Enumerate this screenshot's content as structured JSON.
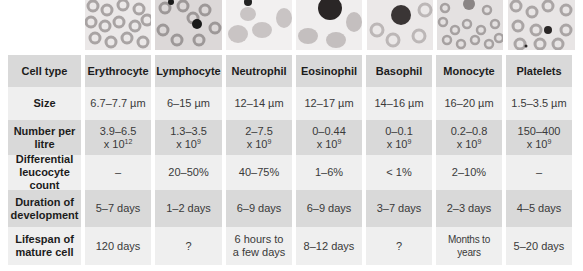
{
  "columns": [
    {
      "key": "erythrocyte",
      "label": "Erythrocyte",
      "size": "6.7–7.7 µm",
      "number_line1": "3.9–6.5",
      "number_base": "x 10",
      "number_exp": "12",
      "differential": "–",
      "duration": "5–7 days",
      "lifespan": "120 days"
    },
    {
      "key": "lymphocyte",
      "label": "Lymphocyte",
      "size": "6–15 µm",
      "number_line1": "1.3–3.5",
      "number_base": "x 10",
      "number_exp": "9",
      "differential": "20–50%",
      "duration": "1–2 days",
      "lifespan": "?"
    },
    {
      "key": "neutrophil",
      "label": "Neutrophil",
      "size": "12–14 µm",
      "number_line1": "2–7.5",
      "number_base": "x 10",
      "number_exp": "9",
      "differential": "40–75%",
      "duration": "6–9 days",
      "lifespan": "6 hours to a few days"
    },
    {
      "key": "eosinophil",
      "label": "Eosinophil",
      "size": "12–17 µm",
      "number_line1": "0–0.44",
      "number_base": "x 10",
      "number_exp": "9",
      "differential": "1–6%",
      "duration": "6–9 days",
      "lifespan": "8–12 days"
    },
    {
      "key": "basophil",
      "label": "Basophil",
      "size": "14–16 µm",
      "number_line1": "0–0.1",
      "number_base": "x 10",
      "number_exp": "9",
      "differential": "< 1%",
      "duration": "3–7 days",
      "lifespan": "?"
    },
    {
      "key": "monocyte",
      "label": "Monocyte",
      "size": "16–20 µm",
      "number_line1": "0.2–0.8",
      "number_base": "x 10",
      "number_exp": "9",
      "differential": "2–10%",
      "duration": "2–3 days",
      "lifespan": "Months to years"
    },
    {
      "key": "platelets",
      "label": "Platelets",
      "size": "1.5–3.5 µm",
      "number_line1": "150–400",
      "number_base": "x 10",
      "number_exp": "9",
      "differential": "–",
      "duration": "4–5 days",
      "lifespan": "5–20 days"
    }
  ],
  "row_labels": {
    "cell_type": "Cell type",
    "size": "Size",
    "number": "Number per litre",
    "differential": "Differential leucocyte count",
    "duration": "Duration of development",
    "lifespan": "Lifespan of mature cell"
  },
  "images": [
    {
      "name": "erythrocyte-micrograph",
      "x": 85,
      "w": 66
    },
    {
      "name": "lymphocyte-micrograph",
      "x": 155,
      "w": 67
    },
    {
      "name": "neutrophil-micrograph",
      "x": 226,
      "w": 66
    },
    {
      "name": "eosinophil-micrograph",
      "x": 296,
      "w": 66
    },
    {
      "name": "basophil-micrograph",
      "x": 367,
      "w": 66
    },
    {
      "name": "monocyte-micrograph",
      "x": 437,
      "w": 66
    },
    {
      "name": "platelets-micrograph",
      "x": 508,
      "w": 67
    }
  ],
  "colors": {
    "header_bg": "#d9d9d9",
    "light_bg": "#efefef",
    "dark_bg": "#d9d9d9",
    "text": "#3a3a3a"
  }
}
